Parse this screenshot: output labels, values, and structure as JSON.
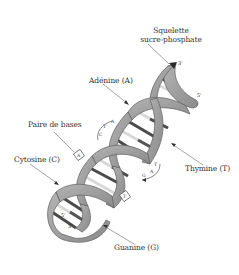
{
  "diagram": {
    "colors": {
      "strand": "#9a9a9a",
      "strand_edge": "#5e5e5e",
      "base_dark": "#4a4a4a",
      "base_light": "#d8d8d8",
      "text": "#333333",
      "leader": "#666666"
    },
    "labels": {
      "backbone_line1": "Squelette",
      "backbone_line2": "sucre-phosphate",
      "adenine": "Adénine (A)",
      "base_pair": "Paire de bases",
      "cytosine": "Cytosine (C)",
      "thymine": "Thymine (T)",
      "guanine": "Guanine (G)"
    },
    "strand_ends": {
      "top_a": "3'",
      "top_b": "5'",
      "bottom_a": "5'",
      "bottom_b": "3'"
    },
    "pair_annotations": {
      "upper": {
        "letters": [
          "T",
          "A",
          "C"
        ]
      },
      "lower": {
        "letters": [
          "T",
          "A",
          "G"
        ]
      },
      "box_upper": "A",
      "box_lower": "T"
    }
  }
}
